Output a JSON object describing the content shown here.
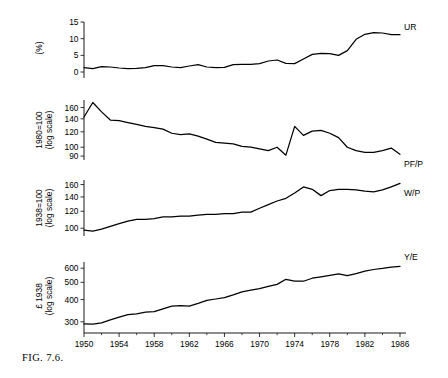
{
  "figure": {
    "caption_prefix": "FIG.",
    "caption_number": "7.6.",
    "caption_full": "FIG. 7.6."
  },
  "xaxis": {
    "label": "",
    "ticks": [
      "1950",
      "1954",
      "1958",
      "1962",
      "1966",
      "1970",
      "1974",
      "1978",
      "1982",
      "1986"
    ],
    "minor_step_years": 2,
    "range": [
      1950,
      1986
    ]
  },
  "panels": [
    {
      "id": "unemployment-rate",
      "series_label": "UR",
      "ylabel_lines": [
        "(%)"
      ],
      "scale": "linear",
      "yticks": [
        "0",
        "5",
        "10",
        "15"
      ]
    },
    {
      "id": "relative-price-of-fuel",
      "series_label": "PF/P",
      "ylabel_lines": [
        "1980=100",
        "(log scale)"
      ],
      "scale": "log",
      "yticks": [
        "90",
        "100",
        "120",
        "140",
        "160"
      ]
    },
    {
      "id": "real-wage",
      "series_label": "W/P",
      "ylabel_lines": [
        "1938=100",
        "(log scale)"
      ],
      "scale": "log",
      "yticks": [
        "100",
        "120",
        "140",
        "160"
      ]
    },
    {
      "id": "output-per-head",
      "series_label": "Y/E",
      "ylabel_lines": [
        "£ 1938",
        "(log scale)"
      ],
      "scale": "log",
      "yticks": [
        "300",
        "400",
        "500",
        "600"
      ]
    }
  ],
  "chart_data": [
    {
      "type": "line",
      "title": "",
      "xlabel": "",
      "ylabel": "(%)",
      "yscale": "linear",
      "ylim": [
        0,
        15
      ],
      "yticks": [
        0,
        5,
        10,
        15
      ],
      "legend": [
        "UR"
      ],
      "series": [
        {
          "name": "UR",
          "x": [
            1950,
            1951,
            1952,
            1953,
            1954,
            1955,
            1956,
            1957,
            1958,
            1959,
            1960,
            1961,
            1962,
            1963,
            1964,
            1965,
            1966,
            1967,
            1968,
            1969,
            1970,
            1971,
            1972,
            1973,
            1974,
            1975,
            1976,
            1977,
            1978,
            1979,
            1980,
            1981,
            1982,
            1983,
            1984,
            1985,
            1986
          ],
          "values": [
            1.3,
            1.0,
            1.6,
            1.5,
            1.2,
            1.0,
            1.1,
            1.3,
            1.9,
            1.9,
            1.5,
            1.3,
            1.8,
            2.2,
            1.5,
            1.3,
            1.4,
            2.2,
            2.3,
            2.3,
            2.5,
            3.3,
            3.6,
            2.6,
            2.5,
            3.9,
            5.3,
            5.6,
            5.5,
            5.0,
            6.4,
            9.8,
            11.3,
            11.8,
            11.7,
            11.2,
            11.2
          ]
        }
      ]
    },
    {
      "type": "line",
      "title": "",
      "xlabel": "",
      "ylabel": "1980=100 (log scale)",
      "yscale": "log",
      "ylim": [
        88,
        175
      ],
      "yticks": [
        90,
        100,
        120,
        140,
        160
      ],
      "legend": [
        "PF/P"
      ],
      "series": [
        {
          "name": "PF/P",
          "x": [
            1950,
            1951,
            1952,
            1953,
            1954,
            1955,
            1956,
            1957,
            1958,
            1959,
            1960,
            1961,
            1962,
            1963,
            1964,
            1965,
            1966,
            1967,
            1968,
            1969,
            1970,
            1971,
            1972,
            1973,
            1974,
            1975,
            1976,
            1977,
            1978,
            1979,
            1980,
            1981,
            1982,
            1983,
            1984,
            1985,
            1986
          ],
          "values": [
            143,
            170,
            152,
            138,
            137,
            134,
            131,
            128,
            126,
            124,
            118,
            116,
            117,
            114,
            110,
            106,
            105,
            104,
            101,
            100,
            98,
            96,
            100,
            91,
            128,
            115,
            121,
            122,
            118,
            112,
            100,
            96,
            94,
            94,
            96,
            99,
            92
          ]
        }
      ]
    },
    {
      "type": "line",
      "title": "",
      "xlabel": "",
      "ylabel": "1938=100 (log scale)",
      "yscale": "log",
      "ylim": [
        95,
        168
      ],
      "yticks": [
        100,
        120,
        140,
        160
      ],
      "legend": [
        "W/P"
      ],
      "series": [
        {
          "name": "W/P",
          "x": [
            1950,
            1951,
            1952,
            1953,
            1954,
            1955,
            1956,
            1957,
            1958,
            1959,
            1960,
            1961,
            1962,
            1963,
            1964,
            1965,
            1966,
            1967,
            1968,
            1969,
            1970,
            1971,
            1972,
            1973,
            1974,
            1975,
            1976,
            1977,
            1978,
            1979,
            1980,
            1981,
            1982,
            1983,
            1984,
            1985,
            1986
          ],
          "values": [
            98,
            97,
            99,
            102,
            105,
            108,
            110,
            110,
            111,
            113,
            113,
            114,
            114,
            115,
            116,
            116,
            117,
            117,
            119,
            119,
            124,
            129,
            134,
            138,
            146,
            156,
            152,
            142,
            150,
            152,
            152,
            151,
            149,
            148,
            151,
            156,
            162
          ]
        }
      ]
    },
    {
      "type": "line",
      "title": "",
      "xlabel": "",
      "ylabel": "£ 1938 (log scale)",
      "yscale": "log",
      "ylim": [
        270,
        650
      ],
      "yticks": [
        300,
        400,
        500,
        600
      ],
      "legend": [
        "Y/E"
      ],
      "series": [
        {
          "name": "Y/E",
          "x": [
            1950,
            1951,
            1952,
            1953,
            1954,
            1955,
            1956,
            1957,
            1958,
            1959,
            1960,
            1961,
            1962,
            1963,
            1964,
            1965,
            1966,
            1967,
            1968,
            1969,
            1970,
            1971,
            1972,
            1973,
            1974,
            1975,
            1976,
            1977,
            1978,
            1979,
            1980,
            1981,
            1982,
            1983,
            1984,
            1985,
            1986
          ],
          "values": [
            292,
            291,
            296,
            308,
            319,
            329,
            333,
            340,
            342,
            355,
            368,
            370,
            368,
            381,
            396,
            403,
            410,
            425,
            442,
            452,
            461,
            474,
            487,
            520,
            508,
            507,
            527,
            537,
            547,
            558,
            545,
            560,
            578,
            590,
            598,
            608,
            615
          ]
        }
      ]
    }
  ]
}
